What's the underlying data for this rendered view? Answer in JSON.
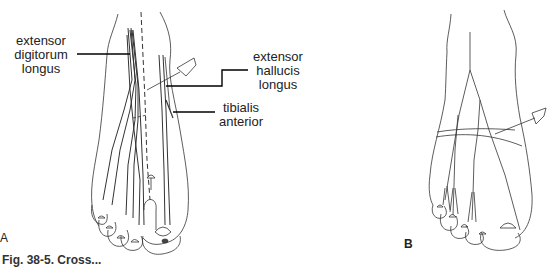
{
  "figure": {
    "panels": [
      {
        "id": "A",
        "label": "A"
      },
      {
        "id": "B",
        "label": "B"
      }
    ],
    "labels": {
      "edl": "extensor digitorum longus",
      "edl_lines": [
        "extensor",
        "digitorum",
        "longus"
      ],
      "ehl_lines": [
        "extensor",
        "hallucis",
        "longus"
      ],
      "ta_lines": [
        "tibialis",
        "anterior"
      ]
    },
    "caption": "Fig. 38-5. Cross..."
  }
}
